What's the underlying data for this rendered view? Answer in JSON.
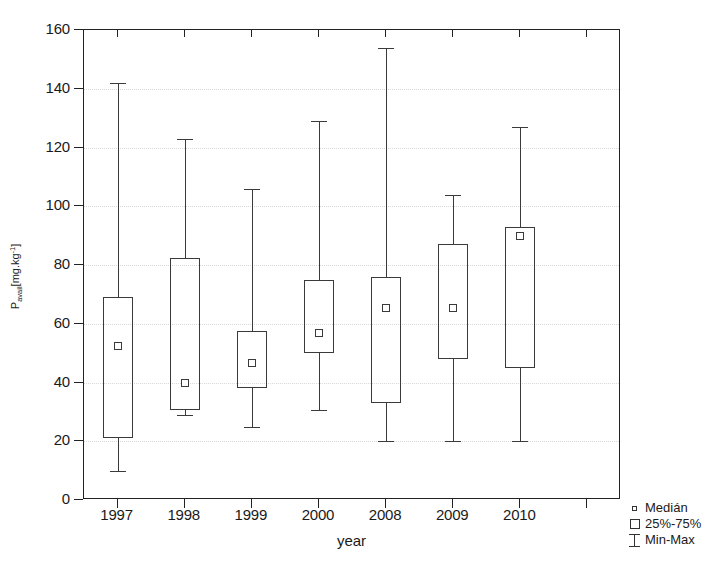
{
  "chart_data": {
    "type": "box",
    "title": "",
    "xlabel": "year",
    "ylabel": "P_avail [mg.kg-1]",
    "ylabel_parts": {
      "base": "P",
      "sub": "avail",
      "unit_open": "[mg.kg",
      "sup": "-1",
      "unit_close": "]"
    },
    "categories": [
      "1997",
      "1998",
      "1999",
      "2000",
      "2008",
      "2009",
      "2010"
    ],
    "ylim": [
      0,
      160
    ],
    "ytick_labels": [
      "0",
      "20",
      "40",
      "60",
      "80",
      "100",
      "120",
      "140",
      "160"
    ],
    "yticks": [
      0,
      20,
      40,
      60,
      80,
      100,
      120,
      140,
      160
    ],
    "grid": true,
    "grid_axis": "y",
    "legend_position": "outside-bottom-right",
    "boxes": [
      {
        "category": "1997",
        "min": 10,
        "q1": 21,
        "median": 52.5,
        "q3": 69,
        "max": 142
      },
      {
        "category": "1998",
        "min": 29,
        "q1": 30.5,
        "median": 40,
        "q3": 82.5,
        "max": 123
      },
      {
        "category": "1999",
        "min": 25,
        "q1": 38,
        "median": 46.5,
        "q3": 57.5,
        "max": 106
      },
      {
        "category": "2000",
        "min": 30.5,
        "q1": 50,
        "median": 57,
        "q3": 75,
        "max": 129
      },
      {
        "category": "2008",
        "min": 20,
        "q1": 33,
        "median": 65.5,
        "q3": 76,
        "max": 154
      },
      {
        "category": "2009",
        "min": 20,
        "q1": 48,
        "median": 65.5,
        "q3": 87,
        "max": 104
      },
      {
        "category": "2010",
        "min": 20,
        "q1": 45,
        "median": 90,
        "q3": 93,
        "max": 127
      }
    ],
    "legend": [
      {
        "symbol": "small-square",
        "label": "Medián"
      },
      {
        "symbol": "open-square",
        "label": "25%-75%"
      },
      {
        "symbol": "i-beam",
        "label": "Min-Max"
      }
    ],
    "colors": {
      "line": "#3a3a3a",
      "axis": "#222222",
      "grid": "#d9d9d9",
      "background": "#ffffff"
    }
  }
}
